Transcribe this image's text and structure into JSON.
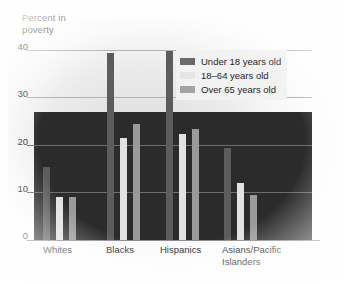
{
  "chart_data": {
    "type": "bar",
    "title": "",
    "subtitle": "",
    "xlabel": "",
    "ylabel": "Percent in\npoverty",
    "ylim": [
      0,
      40
    ],
    "yticks": [
      0,
      10,
      20,
      30,
      40
    ],
    "ytick_labels": [
      "0",
      "10",
      "20",
      "30",
      "40"
    ],
    "grid": true,
    "legend_position": "upper right",
    "categories": [
      "Whites",
      "Blacks",
      "Hispanics",
      "Asians/Pacific\nIslanders"
    ],
    "series": [
      {
        "name": "Under 18 years old",
        "color": "#5c5c5c",
        "values": [
          15.5,
          39.5,
          40.0,
          19.5
        ]
      },
      {
        "name": "18–64 years old",
        "color": "#e2e2e2",
        "values": [
          9.0,
          21.5,
          22.5,
          12.0
        ]
      },
      {
        "name": "Over 65 years old",
        "color": "#9a9a9a",
        "values": [
          9.0,
          24.5,
          23.5,
          9.5
        ]
      }
    ]
  },
  "axis": {
    "y_title": "Percent in\npoverty"
  },
  "legend": {
    "items": [
      {
        "label": "Under 18 years old",
        "swatch": "legend-swatch-under-18"
      },
      {
        "label": "18–64 years old",
        "swatch": "legend-swatch-18-64"
      },
      {
        "label": "Over 65 years old",
        "swatch": "legend-swatch-over-65"
      }
    ]
  }
}
